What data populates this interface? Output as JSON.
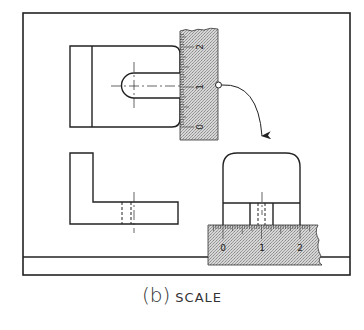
{
  "figure": {
    "caption_letter": "(b)",
    "caption_word": "SCALE"
  },
  "vertical_scale": {
    "labels": [
      "2",
      "1",
      "0"
    ],
    "orientation": "vertical"
  },
  "horizontal_scale": {
    "labels": [
      "0",
      "1",
      "2"
    ],
    "orientation": "horizontal"
  },
  "views": [
    "top-view",
    "front-view",
    "side-view"
  ],
  "colors": {
    "line": "#222222",
    "scale_fill": "#c8c8c8",
    "background": "#ffffff"
  }
}
